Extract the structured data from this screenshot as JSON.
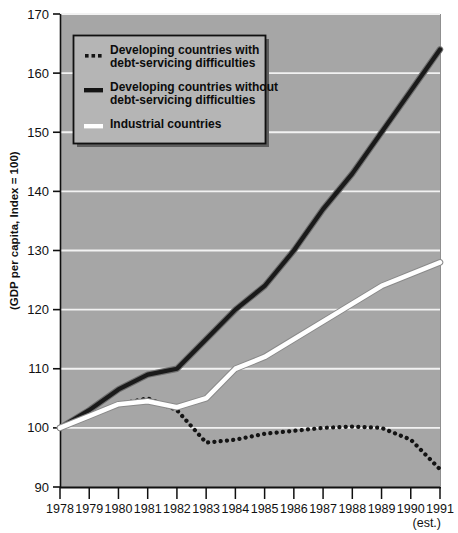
{
  "chart_data": {
    "type": "line",
    "title": "",
    "xlabel": "",
    "ylabel": "(GDP per capita, Index = 100)",
    "x": [
      1978,
      1979,
      1980,
      1981,
      1982,
      1983,
      1984,
      1985,
      1986,
      1987,
      1988,
      1989,
      1990,
      1991
    ],
    "xtick_labels": [
      "1978",
      "1979",
      "1980",
      "1981",
      "1982",
      "1983",
      "1984",
      "1985",
      "1986",
      "1987",
      "1988",
      "1989",
      "1990",
      "1991"
    ],
    "x_note": "(est.)",
    "x_note_applies_to": "1991",
    "ylim": [
      90,
      170
    ],
    "yticks": [
      90,
      100,
      110,
      120,
      130,
      140,
      150,
      160,
      170
    ],
    "ytick_labels": [
      "90",
      "100",
      "110",
      "120",
      "130",
      "140",
      "150",
      "160",
      "170"
    ],
    "grid": "horizontal-white",
    "legend_position": "upper-left-inside",
    "plot_background": "#a6a6a6",
    "gridline_color": "#f2f2f2",
    "series": [
      {
        "name": "Developing countries with debt-servicing difficulties",
        "style": "dotted",
        "color": "#141414",
        "values": [
          100,
          102,
          104,
          105,
          103,
          97.5,
          98,
          99,
          99.5,
          100,
          100.2,
          100,
          98,
          93
        ]
      },
      {
        "name": "Developing countries without debt-servicing difficulties",
        "style": "solid-thick",
        "color": "#1a1a1a",
        "values": [
          100,
          103,
          106.5,
          109,
          110,
          115,
          120,
          124,
          130,
          137,
          143,
          150,
          157,
          164
        ]
      },
      {
        "name": "Industrial countries",
        "style": "solid-white",
        "color": "#ffffff",
        "values": [
          100,
          102,
          104,
          104.5,
          103.5,
          105,
          110,
          112,
          115,
          118,
          121,
          124,
          126,
          128
        ]
      }
    ]
  },
  "legend": {
    "items": [
      {
        "marker": "dotted-swatch",
        "line1": "Developing countries with",
        "line2": "debt-servicing difficulties"
      },
      {
        "marker": "solid-dark-swatch",
        "line1": "Developing countries without",
        "line2": "debt-servicing difficulties"
      },
      {
        "marker": "solid-white-swatch",
        "line1": "Industrial countries",
        "line2": ""
      }
    ]
  },
  "colors": {
    "plot_bg": "#a6a6a6",
    "grid": "#f2f2f2",
    "legend_bg": "#b5b5b5",
    "legend_border": "#101010",
    "legend_shadow": "#5e5e5e",
    "dark_series": "#1a1a1a",
    "white_series": "#ffffff",
    "axis": "#101010",
    "page_bg": "#ffffff"
  }
}
